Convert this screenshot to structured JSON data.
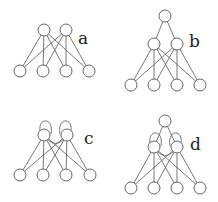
{
  "diagram": {
    "colors": {
      "stroke": "#555555",
      "fill": "#ffffff",
      "text": "#222222"
    },
    "node_radius": 6,
    "panels": [
      {
        "label": "a",
        "label_pos": [
          78,
          44
        ],
        "nodes": {
          "top": [],
          "mid": [
            [
              44,
              30
            ],
            [
              66,
              30
            ]
          ],
          "bottom": [
            [
              20,
              71
            ],
            [
              43,
              71
            ],
            [
              66,
              71
            ],
            [
              89,
              71
            ]
          ]
        },
        "self_loops": false
      },
      {
        "label": "b",
        "label_pos": [
          189,
          47
        ],
        "nodes": {
          "top": [
            [
              165,
              16
            ]
          ],
          "mid": [
            [
              154,
              44
            ],
            [
              177,
              44
            ]
          ],
          "bottom": [
            [
              131,
              85
            ],
            [
              154,
              85
            ],
            [
              177,
              85
            ],
            [
              200,
              85
            ]
          ]
        },
        "self_loops": false
      },
      {
        "label": "c",
        "label_pos": [
          84,
          144
        ],
        "nodes": {
          "top": [],
          "mid": [
            [
              44,
              135
            ],
            [
              67,
              135
            ]
          ],
          "bottom": [
            [
              20,
              175
            ],
            [
              43,
              175
            ],
            [
              66,
              175
            ],
            [
              90,
              175
            ]
          ]
        },
        "self_loops": true
      },
      {
        "label": "d",
        "label_pos": [
          190,
          150
        ],
        "nodes": {
          "top": [
            [
              165,
              121
            ]
          ],
          "mid": [
            [
              154,
              147
            ],
            [
              177,
              147
            ]
          ],
          "bottom": [
            [
              131,
              188
            ],
            [
              154,
              188
            ],
            [
              177,
              188
            ],
            [
              200,
              188
            ]
          ]
        },
        "self_loops": true
      }
    ]
  }
}
